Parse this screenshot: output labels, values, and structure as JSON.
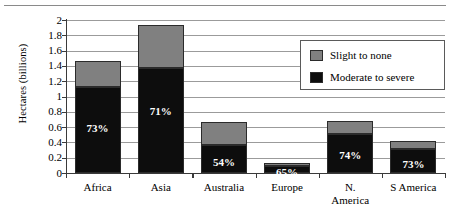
{
  "chart_data": {
    "type": "bar",
    "stacked": true,
    "title": "",
    "xlabel": "",
    "ylabel": "Hectares (billions)",
    "ylim": [
      0,
      2
    ],
    "yticks": [
      "0",
      "0.2",
      "0.4",
      "0.6",
      "0.8",
      "1",
      "1.2",
      "1.4",
      "1.6",
      "1.8",
      "2"
    ],
    "grid": true,
    "legend_position": "upper right",
    "categories": [
      "Africa",
      "Asia",
      "Australia",
      "Europe",
      "N. America",
      "S America"
    ],
    "category_lines": [
      [
        "Africa"
      ],
      [
        "Asia"
      ],
      [
        "Australia"
      ],
      [
        "Europe"
      ],
      [
        "N.",
        "America"
      ],
      [
        "S America"
      ]
    ],
    "series": [
      {
        "name": "Moderate to severe",
        "color": "#0d0d0d",
        "values": [
          1.12,
          1.37,
          0.36,
          0.085,
          0.51,
          0.31
        ]
      },
      {
        "name": "Slight to none",
        "color": "#808080",
        "values": [
          0.34,
          0.56,
          0.31,
          0.045,
          0.17,
          0.11
        ]
      }
    ],
    "totals": [
      1.46,
      1.93,
      0.67,
      0.13,
      0.68,
      0.42
    ],
    "data_labels": [
      "73%",
      "71%",
      "54%",
      "65%",
      "74%",
      "73%"
    ],
    "data_label_meaning": "share of total that is Moderate to severe"
  },
  "legend": {
    "items": [
      {
        "label": "Slight to none",
        "color": "#808080"
      },
      {
        "label": "Moderate to severe",
        "color": "#0d0d0d"
      }
    ]
  }
}
